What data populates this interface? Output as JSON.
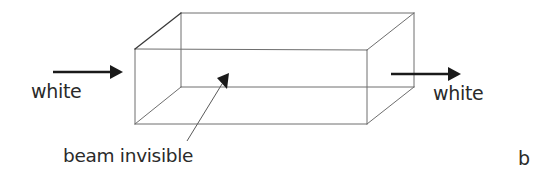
{
  "diagram": {
    "type": "schematic",
    "labels": {
      "input_light": "white",
      "output_light": "white",
      "beam_annotation": "beam invisible",
      "panel_letter": "b"
    },
    "colors": {
      "box_edges": "#6e6e6e",
      "arrows": "#1a1a1a",
      "text": "#2a2a2a",
      "background": "#ffffff"
    },
    "elements": [
      {
        "id": "box",
        "shape": "rectangular prism (wireframe)"
      },
      {
        "id": "input-arrow",
        "shape": "arrow",
        "direction": "right",
        "label": "white"
      },
      {
        "id": "output-arrow",
        "shape": "arrow",
        "direction": "right",
        "label": "white"
      },
      {
        "id": "pointer-arrow",
        "shape": "arrow",
        "direction": "up-right",
        "label": "beam invisible"
      }
    ]
  }
}
